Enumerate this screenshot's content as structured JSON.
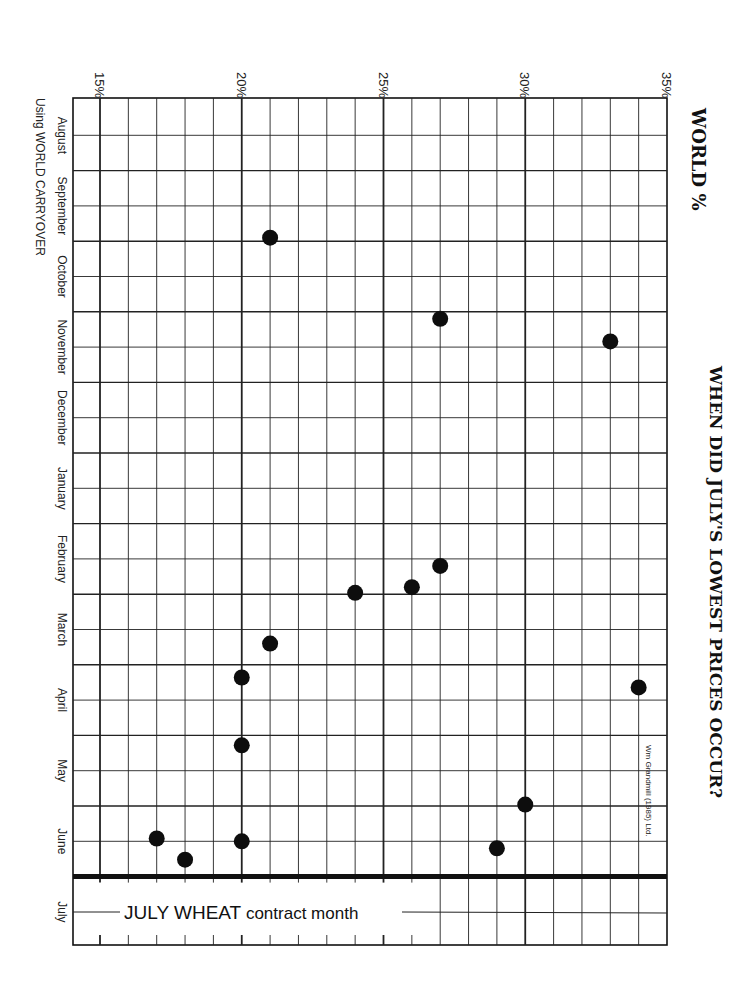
{
  "chart_data": {
    "type": "scatter",
    "title": "WHEN DID JULY'S LOWEST PRICES OCCUR?",
    "axis_title": "WORLD %",
    "subtitle": "Using WORLD CARRYOVER",
    "credit": "Wm Grandmill (1985) Ltd.",
    "xlabel": "World carryover (%)",
    "ylabel": "Month of July wheat's lowest price",
    "xlim": [
      15,
      35
    ],
    "x_ticks": [
      "15%",
      "20%",
      "25%",
      "30%",
      "35%"
    ],
    "x_tick_values": [
      15,
      20,
      25,
      30,
      35
    ],
    "months": [
      "August",
      "September",
      "October",
      "November",
      "December",
      "January",
      "February",
      "March",
      "April",
      "May",
      "June",
      "July"
    ],
    "annotation": {
      "big": "JULY WHEAT",
      "small": " contract month"
    },
    "grid": true,
    "orientation": "rotated-90-clockwise",
    "points": [
      {
        "percent": 21,
        "month_pos": 1.95,
        "month": "October"
      },
      {
        "percent": 27,
        "month_pos": 3.1,
        "month": "November"
      },
      {
        "percent": 33,
        "month_pos": 3.42,
        "month": "November"
      },
      {
        "percent": 27,
        "month_pos": 6.6,
        "month": "February"
      },
      {
        "percent": 26,
        "month_pos": 6.9,
        "month": "February"
      },
      {
        "percent": 24,
        "month_pos": 6.98,
        "month": "February"
      },
      {
        "percent": 21,
        "month_pos": 7.7,
        "month": "March"
      },
      {
        "percent": 20,
        "month_pos": 8.18,
        "month": "March"
      },
      {
        "percent": 34,
        "month_pos": 8.32,
        "month": "April"
      },
      {
        "percent": 20,
        "month_pos": 9.14,
        "month": "May"
      },
      {
        "percent": 30,
        "month_pos": 9.98,
        "month": "May"
      },
      {
        "percent": 17,
        "month_pos": 10.46,
        "month": "June"
      },
      {
        "percent": 20,
        "month_pos": 10.5,
        "month": "June"
      },
      {
        "percent": 29,
        "month_pos": 10.6,
        "month": "June"
      },
      {
        "percent": 18,
        "month_pos": 10.76,
        "month": "June"
      }
    ]
  }
}
